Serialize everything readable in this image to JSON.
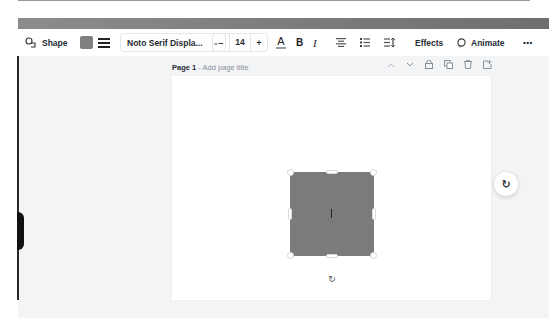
{
  "toolbar": {
    "shape_label": "Shape",
    "shape_icon": "shape-icon",
    "fill_color": "#808080",
    "border_style_icon": "border-style-icon",
    "font_family": "Noto Serif Displa...",
    "font_dropdown_icon": "chevron-down-icon",
    "decrease_label": "−",
    "font_size": "14",
    "increase_label": "+",
    "text_color_icon": "A",
    "bold_label": "B",
    "italic_label": "I",
    "align_icon": "≡",
    "list_icon": "☰",
    "spacing_icon": "☰",
    "effects_label": "Effects",
    "animate_label": "Animate",
    "more_label": "•••"
  },
  "page": {
    "number_label": "Page 1",
    "separator": " - ",
    "title_placeholder": "Add page title",
    "actions": {
      "up": "⌃",
      "down": "⌄",
      "lock": "🔒",
      "duplicate": "⧉",
      "delete": "🗑",
      "add": "⊕"
    }
  },
  "canvas": {
    "shape_color": "#7b7b7b",
    "rotate_icon": "↻",
    "refresh_icon": "↻"
  }
}
